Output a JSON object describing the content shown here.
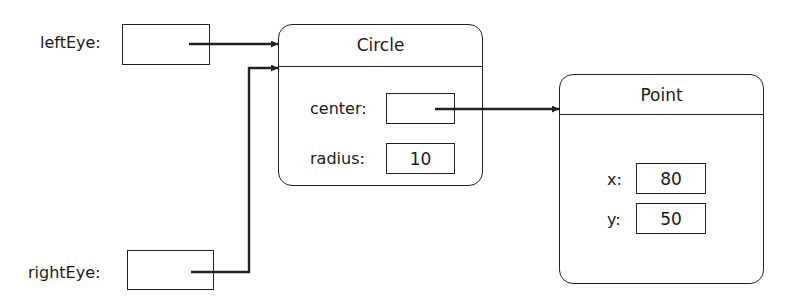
{
  "variables": [
    {
      "name": "leftEye",
      "label": "leftEye:"
    },
    {
      "name": "rightEye",
      "label": "rightEye:"
    }
  ],
  "objects": {
    "circle": {
      "title": "Circle",
      "fields": [
        {
          "name": "center",
          "label": "center:",
          "value": ""
        },
        {
          "name": "radius",
          "label": "radius:",
          "value": "10"
        }
      ]
    },
    "point": {
      "title": "Point",
      "fields": [
        {
          "name": "x",
          "label": "x:",
          "value": "80"
        },
        {
          "name": "y",
          "label": "y:",
          "value": "50"
        }
      ]
    }
  },
  "references": [
    {
      "from": "leftEye",
      "to": "Circle"
    },
    {
      "from": "rightEye",
      "to": "Circle"
    },
    {
      "from": "Circle.center",
      "to": "Point"
    }
  ],
  "colors": {
    "stroke": "#222222",
    "background": "#ffffff"
  }
}
